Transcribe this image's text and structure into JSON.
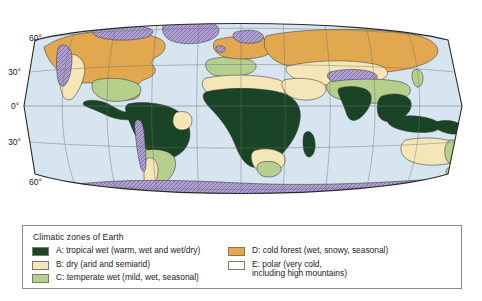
{
  "figure": {
    "kind": "world-climate-zone-map",
    "projection": "robinson-like oval",
    "ocean_color": "#d6e5ef",
    "graticule_color": "#6f6f6f",
    "outline_color": "#2a2a2a"
  },
  "axis": {
    "latitude_labels": [
      {
        "text": "60°",
        "y_px": 38
      },
      {
        "text": "30°",
        "y_px": 72
      },
      {
        "text": "0°",
        "y_px": 106
      },
      {
        "text": "30°",
        "y_px": 142
      },
      {
        "text": "60°",
        "y_px": 182
      }
    ]
  },
  "legend": {
    "title": "Climatic zones of Earth",
    "columns": [
      {
        "items": [
          {
            "key": "A",
            "color": "#1a4526",
            "hatched": false,
            "label": "A: tropical wet (warm, wet and wet/dry)"
          },
          {
            "key": "B",
            "color": "#f5e6b8",
            "hatched": false,
            "label": "B: dry (arid and semiarid)"
          },
          {
            "key": "C",
            "color": "#b5cf8e",
            "hatched": false,
            "label": "C: temperate wet (mild, wet, seasonal)"
          }
        ]
      },
      {
        "items": [
          {
            "key": "D",
            "color": "#e2a950",
            "hatched": false,
            "label": "D: cold forest (wet, snowy, seasonal)"
          },
          {
            "key": "E",
            "color": "#b0a0d0",
            "hatched": true,
            "label": "E: polar (very cold,\ninclud­ing high mountains)"
          }
        ]
      }
    ]
  },
  "colors": {
    "tropical_wet": "#1a4526",
    "dry": "#f5e6b8",
    "temperate_wet": "#b5cf8e",
    "cold_forest": "#e2a950",
    "polar": "#b0a0d0",
    "ocean": "#d6e5ef",
    "land_outline": "#3a3a3a"
  }
}
